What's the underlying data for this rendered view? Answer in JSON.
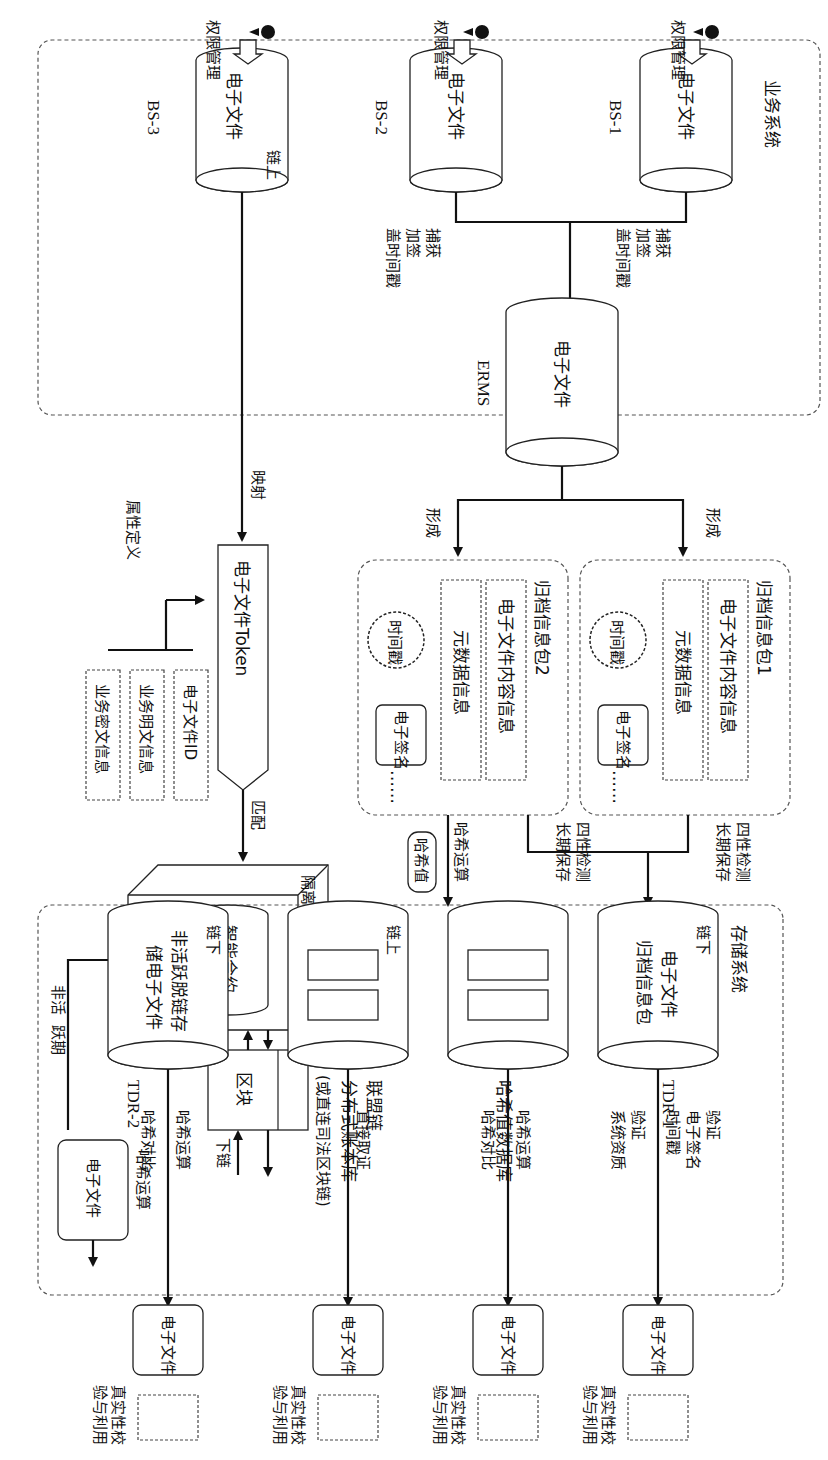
{
  "business_system": {
    "title": "业务系统",
    "systems": [
      {
        "id": "BS-1",
        "db_label": "电子文件",
        "chain_tag": "",
        "perm_label": "权限管理"
      },
      {
        "id": "BS-2",
        "db_label": "电子文件",
        "chain_tag": "",
        "perm_label": "权限管理"
      },
      {
        "id": "BS-3",
        "db_label": "电子文件",
        "chain_tag": "链上",
        "perm_label": "权限管理"
      }
    ],
    "capture_label": [
      "捕获",
      "加签",
      "盖时间戳"
    ]
  },
  "erms": {
    "db_label": "电子文件",
    "name": "ERMS",
    "form_label": "形成"
  },
  "archive_packages": [
    {
      "title": "归档信息包1",
      "content_info": "电子文件内容信息",
      "metadata_info": "元数据信息",
      "timestamp": "时间戳",
      "signature": "电子签名",
      "ellipsis": "……",
      "out_label": [
        "四性检测",
        "长期保存"
      ]
    },
    {
      "title": "归档信息包2",
      "content_info": "电子文件内容信息",
      "metadata_info": "元数据信息",
      "timestamp": "时间戳",
      "signature": "电子签名",
      "ellipsis": "……",
      "out_label": [
        "四性检测",
        "长期保存"
      ]
    }
  ],
  "hash_path": {
    "op_label": "哈希运算",
    "value_tag": "哈希值"
  },
  "token": {
    "map_label": "映射",
    "label": "电子文件Token",
    "match_label": "匹配",
    "attr_def_label": "属性定义",
    "attributes": [
      "电子文件ID",
      "业务明文信息",
      "业务密文信息"
    ]
  },
  "sandbox": {
    "title": "隔离沙箱",
    "contract": "智能合约",
    "inactive_label": [
      "非活",
      "跃期"
    ]
  },
  "block": {
    "label": "区块",
    "down_chain_label": "下链"
  },
  "inactive_file": {
    "label": "电子文件",
    "op_label": "哈希运算",
    "value_tag": "哈希值"
  },
  "storage_system": {
    "title": "存储系统",
    "tdr1": {
      "name": "TDR-1",
      "tag": "链下",
      "line1": "电子文件",
      "line2": "归档信息包"
    },
    "hash_db": {
      "label": "哈希值数据库"
    },
    "consortium": {
      "tag": "链上",
      "line1": "联盟链",
      "line2": "分布式账本库",
      "line3": "(或直连司法区块链)"
    },
    "offchain2": {
      "tag": "链下",
      "line1": "非活跃脱链存",
      "line2": "储电子文件",
      "name": "TDR-2"
    }
  },
  "verification": [
    {
      "labels": [
        "验证",
        "电子签名",
        "时间戳",
        "验证",
        "系统资质"
      ],
      "file": "电子文件",
      "user_label": [
        "真实性校",
        "验与利用"
      ]
    },
    {
      "labels": [
        "哈希运算",
        "哈希对比"
      ],
      "file": "电子文件",
      "user_label": [
        "真实性校",
        "验与利用"
      ]
    },
    {
      "labels": [
        "直接取证"
      ],
      "file": "电子文件",
      "user_label": [
        "真实性校",
        "验与利用"
      ]
    },
    {
      "labels": [
        "哈希运算",
        "哈希对比"
      ],
      "file": "电子文件",
      "user_label": [
        "真实性校",
        "验与利用"
      ]
    }
  ]
}
